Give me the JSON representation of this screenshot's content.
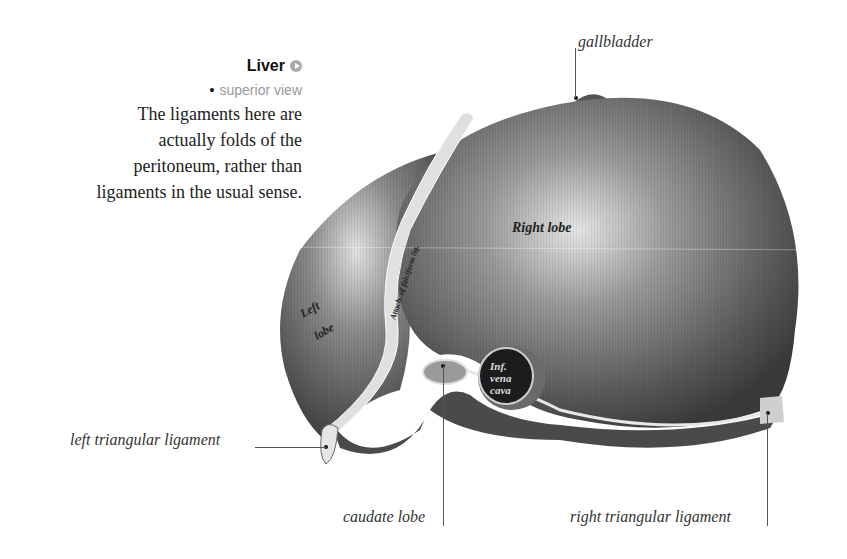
{
  "figure": {
    "title": "Liver",
    "title_icon": "play-circle-icon",
    "subtitle": "superior view",
    "subtitle_bullet": "•",
    "description_lines": [
      "The ligaments here are",
      "actually folds of the",
      "peritoneum, rather than",
      "ligaments in the usual sense."
    ]
  },
  "callouts": {
    "gallbladder": "gallbladder",
    "left_triangular_ligament": "left triangular ligament",
    "caudate_lobe": "caudate lobe",
    "right_triangular_ligament": "right triangular ligament"
  },
  "engraved_labels": {
    "right_lobe": "Right lobe",
    "left_lobe_1": "Left",
    "left_lobe_2": "lobe",
    "falciform": "Attach. of falciform lig.",
    "ivc_1": "Inf.",
    "ivc_2": "vena",
    "ivc_3": "cava"
  },
  "colors": {
    "title": "#111111",
    "subtitle": "#999999",
    "icon": "#aaaaaa",
    "organ_dark": "#3a3a3a",
    "organ_mid": "#6e6e6e",
    "organ_light": "#d8d8d8"
  }
}
